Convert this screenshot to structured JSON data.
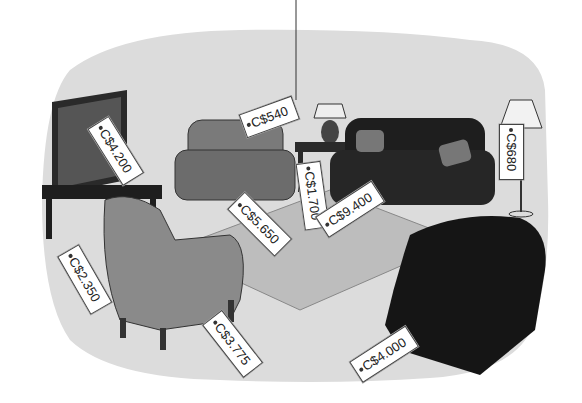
{
  "scene": {
    "description": "Living room furniture with price tags",
    "colors": {
      "backdrop": "#dcdcdc",
      "rug": "#bdbdbd",
      "dark": "#1e1e1e",
      "mid": "#7a7a7a",
      "light": "#9a9a9a"
    }
  },
  "items": [
    {
      "name": "television",
      "price": "C$4.200"
    },
    {
      "name": "armchair-light",
      "price": "C$3.775"
    },
    {
      "name": "tv-stand",
      "price": "C$2.350"
    },
    {
      "name": "loveseat",
      "price": "C$5.650"
    },
    {
      "name": "table-lamp",
      "price": "C$540"
    },
    {
      "name": "side-table",
      "price": "C$1.700"
    },
    {
      "name": "sofa",
      "price": "C$9.400"
    },
    {
      "name": "floor-lamp",
      "price": "C$680"
    },
    {
      "name": "armchair-dark",
      "price": "C$4.000"
    }
  ]
}
